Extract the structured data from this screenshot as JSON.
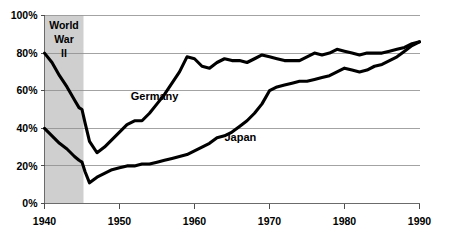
{
  "chart_data": {
    "type": "line",
    "title": "",
    "xlabel": "",
    "ylabel": "",
    "xlim": [
      1940,
      1990
    ],
    "ylim": [
      0,
      100
    ],
    "grid": true,
    "legend_position": "inline-labels",
    "y_ticks": [
      "0%",
      "20%",
      "40%",
      "60%",
      "80%",
      "100%"
    ],
    "y_tick_values": [
      0,
      20,
      40,
      60,
      80,
      100
    ],
    "x_ticks": [
      "1940",
      "1950",
      "1960",
      "1970",
      "1980",
      "1990"
    ],
    "x_tick_values": [
      1940,
      1950,
      1960,
      1970,
      1980,
      1990
    ],
    "annotations": [
      {
        "name": "world-war-two-band",
        "lines": [
          "World",
          "War",
          "II"
        ],
        "x_start": 1940,
        "x_end": 1945.2,
        "fill": "#cfcfcf"
      }
    ],
    "series": [
      {
        "name": "Germany",
        "label": "Germany",
        "label_x": 1951.5,
        "label_y": 55,
        "color": "#000000",
        "x": [
          1940,
          1941,
          1942,
          1943,
          1944,
          1944.6,
          1945,
          1945.4,
          1946,
          1947,
          1948,
          1949,
          1950,
          1951,
          1952,
          1953,
          1954,
          1955,
          1956,
          1957,
          1958,
          1959,
          1960,
          1961,
          1962,
          1963,
          1964,
          1965,
          1966,
          1967,
          1968,
          1969,
          1970,
          1971,
          1972,
          1973,
          1974,
          1975,
          1976,
          1977,
          1978,
          1979,
          1980,
          1981,
          1982,
          1983,
          1984,
          1985,
          1986,
          1987,
          1988,
          1989,
          1990
        ],
        "values": [
          80,
          75,
          68,
          62,
          55,
          51,
          50,
          43,
          33,
          27,
          30,
          34,
          38,
          42,
          44,
          44,
          48,
          53,
          58,
          64,
          70,
          78,
          77,
          73,
          72,
          75,
          77,
          76,
          76,
          75,
          77,
          79,
          78,
          77,
          76,
          76,
          76,
          78,
          80,
          79,
          80,
          82,
          81,
          80,
          79,
          80,
          80,
          80,
          81,
          82,
          83,
          85,
          86
        ]
      },
      {
        "name": "Japan",
        "label": "Japan",
        "label_x": 1964,
        "label_y": 33,
        "color": "#000000",
        "x": [
          1940,
          1941,
          1942,
          1943,
          1944,
          1944.6,
          1945,
          1945.4,
          1946,
          1947,
          1948,
          1949,
          1950,
          1951,
          1952,
          1953,
          1954,
          1955,
          1956,
          1957,
          1958,
          1959,
          1960,
          1961,
          1962,
          1963,
          1964,
          1965,
          1966,
          1967,
          1968,
          1969,
          1970,
          1971,
          1972,
          1973,
          1974,
          1975,
          1976,
          1977,
          1978,
          1979,
          1980,
          1981,
          1982,
          1983,
          1984,
          1985,
          1986,
          1987,
          1988,
          1989,
          1990
        ],
        "values": [
          40,
          36,
          32,
          29,
          25,
          23,
          22,
          17,
          11,
          14,
          16,
          18,
          19,
          20,
          20,
          21,
          21,
          22,
          23,
          24,
          25,
          26,
          28,
          30,
          32,
          35,
          36,
          38,
          41,
          44,
          48,
          53,
          60,
          62,
          63,
          64,
          65,
          65,
          66,
          67,
          68,
          70,
          72,
          71,
          70,
          71,
          73,
          74,
          76,
          78,
          81,
          84,
          86
        ]
      }
    ]
  }
}
